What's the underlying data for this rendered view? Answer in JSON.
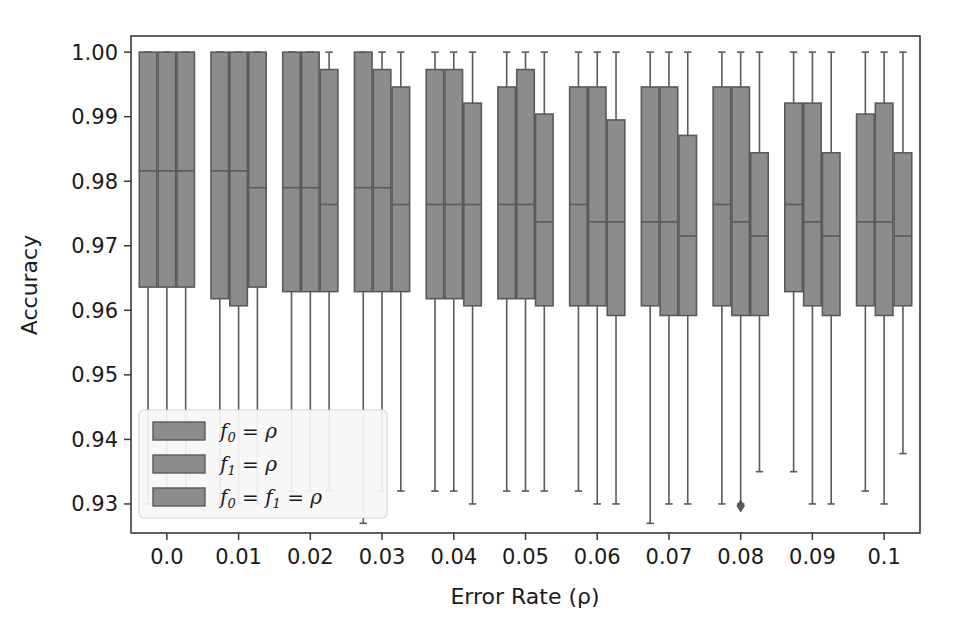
{
  "chart_data": {
    "type": "box",
    "title": "",
    "xlabel": "Error Rate (ρ)",
    "ylabel": "Accuracy",
    "grid": false,
    "legend_position": "lower left",
    "xlim": [
      -0.005,
      0.105
    ],
    "ylim": [
      0.9255,
      1.0025
    ],
    "ytick_labels": [
      "0.93",
      "0.94",
      "0.95",
      "0.96",
      "0.97",
      "0.98",
      "0.99",
      "1.00"
    ],
    "ytick_values": [
      0.93,
      0.94,
      0.95,
      0.96,
      0.97,
      0.98,
      0.99,
      1.0
    ],
    "xtick_labels": [
      "0.0",
      "0.01",
      "0.02",
      "0.03",
      "0.04",
      "0.05",
      "0.06",
      "0.07",
      "0.08",
      "0.09",
      "0.1"
    ],
    "categories": [
      0.0,
      0.01,
      0.02,
      0.03,
      0.04,
      0.05,
      0.06,
      0.07,
      0.08,
      0.09,
      0.1
    ],
    "series": [
      {
        "name": "f_0 = ρ",
        "legend_label": "f₀ = ρ",
        "color": "#8c8c8c",
        "boxes": [
          {
            "category": 0.0,
            "whislo": 0.93,
            "q1": 0.9636,
            "med": 0.9816,
            "q3": 1.0,
            "whishi": 1.0,
            "fliers": []
          },
          {
            "category": 0.01,
            "whislo": 0.93,
            "q1": 0.9618,
            "med": 0.9816,
            "q3": 1.0,
            "whishi": 1.0,
            "fliers": []
          },
          {
            "category": 0.02,
            "whislo": 0.932,
            "q1": 0.9629,
            "med": 0.979,
            "q3": 1.0,
            "whishi": 1.0,
            "fliers": []
          },
          {
            "category": 0.03,
            "whislo": 0.927,
            "q1": 0.9629,
            "med": 0.979,
            "q3": 1.0,
            "whishi": 1.0,
            "fliers": []
          },
          {
            "category": 0.04,
            "whislo": 0.932,
            "q1": 0.9618,
            "med": 0.9764,
            "q3": 0.9973,
            "whishi": 1.0,
            "fliers": []
          },
          {
            "category": 0.05,
            "whislo": 0.932,
            "q1": 0.9618,
            "med": 0.9764,
            "q3": 0.9946,
            "whishi": 1.0,
            "fliers": []
          },
          {
            "category": 0.06,
            "whislo": 0.932,
            "q1": 0.9607,
            "med": 0.9764,
            "q3": 0.9946,
            "whishi": 1.0,
            "fliers": []
          },
          {
            "category": 0.07,
            "whislo": 0.927,
            "q1": 0.9607,
            "med": 0.9737,
            "q3": 0.9946,
            "whishi": 1.0,
            "fliers": []
          },
          {
            "category": 0.08,
            "whislo": 0.93,
            "q1": 0.9607,
            "med": 0.9764,
            "q3": 0.9946,
            "whishi": 1.0,
            "fliers": []
          },
          {
            "category": 0.09,
            "whislo": 0.935,
            "q1": 0.9629,
            "med": 0.9764,
            "q3": 0.9921,
            "whishi": 1.0,
            "fliers": []
          },
          {
            "category": 0.1,
            "whislo": 0.932,
            "q1": 0.9607,
            "med": 0.9737,
            "q3": 0.9904,
            "whishi": 1.0,
            "fliers": []
          }
        ]
      },
      {
        "name": "f_1 = ρ",
        "legend_label": "f₁ = ρ",
        "color": "#8c8c8c",
        "boxes": [
          {
            "category": 0.0,
            "whislo": 0.93,
            "q1": 0.9636,
            "med": 0.9816,
            "q3": 1.0,
            "whishi": 1.0,
            "fliers": []
          },
          {
            "category": 0.01,
            "whislo": 0.93,
            "q1": 0.9607,
            "med": 0.9816,
            "q3": 1.0,
            "whishi": 1.0,
            "fliers": []
          },
          {
            "category": 0.02,
            "whislo": 0.932,
            "q1": 0.9629,
            "med": 0.979,
            "q3": 1.0,
            "whishi": 1.0,
            "fliers": []
          },
          {
            "category": 0.03,
            "whislo": 0.932,
            "q1": 0.9629,
            "med": 0.979,
            "q3": 0.9973,
            "whishi": 1.0,
            "fliers": []
          },
          {
            "category": 0.04,
            "whislo": 0.932,
            "q1": 0.9618,
            "med": 0.9764,
            "q3": 0.9973,
            "whishi": 1.0,
            "fliers": []
          },
          {
            "category": 0.05,
            "whislo": 0.932,
            "q1": 0.9618,
            "med": 0.9764,
            "q3": 0.9973,
            "whishi": 1.0,
            "fliers": []
          },
          {
            "category": 0.06,
            "whislo": 0.93,
            "q1": 0.9607,
            "med": 0.9737,
            "q3": 0.9946,
            "whishi": 1.0,
            "fliers": []
          },
          {
            "category": 0.07,
            "whislo": 0.93,
            "q1": 0.9592,
            "med": 0.9737,
            "q3": 0.9946,
            "whishi": 1.0,
            "fliers": []
          },
          {
            "category": 0.08,
            "whislo": 0.93,
            "q1": 0.9592,
            "med": 0.9737,
            "q3": 0.9946,
            "whishi": 1.0,
            "fliers": [
              0.9297
            ]
          },
          {
            "category": 0.09,
            "whislo": 0.93,
            "q1": 0.9607,
            "med": 0.9737,
            "q3": 0.9921,
            "whishi": 1.0,
            "fliers": []
          },
          {
            "category": 0.1,
            "whislo": 0.93,
            "q1": 0.9592,
            "med": 0.9737,
            "q3": 0.9921,
            "whishi": 1.0,
            "fliers": []
          }
        ]
      },
      {
        "name": "f_0 = f_1 = ρ",
        "legend_label": "f₀ = f₁ = ρ",
        "color": "#8c8c8c",
        "boxes": [
          {
            "category": 0.0,
            "whislo": 0.93,
            "q1": 0.9636,
            "med": 0.9816,
            "q3": 1.0,
            "whishi": 1.0,
            "fliers": []
          },
          {
            "category": 0.01,
            "whislo": 0.93,
            "q1": 0.9636,
            "med": 0.979,
            "q3": 1.0,
            "whishi": 1.0,
            "fliers": []
          },
          {
            "category": 0.02,
            "whislo": 0.932,
            "q1": 0.9629,
            "med": 0.9764,
            "q3": 0.9973,
            "whishi": 1.0,
            "fliers": []
          },
          {
            "category": 0.03,
            "whislo": 0.932,
            "q1": 0.9629,
            "med": 0.9764,
            "q3": 0.9946,
            "whishi": 1.0,
            "fliers": []
          },
          {
            "category": 0.04,
            "whislo": 0.93,
            "q1": 0.9607,
            "med": 0.9764,
            "q3": 0.9921,
            "whishi": 1.0,
            "fliers": []
          },
          {
            "category": 0.05,
            "whislo": 0.932,
            "q1": 0.9607,
            "med": 0.9737,
            "q3": 0.9904,
            "whishi": 1.0,
            "fliers": []
          },
          {
            "category": 0.06,
            "whislo": 0.93,
            "q1": 0.9592,
            "med": 0.9737,
            "q3": 0.9895,
            "whishi": 1.0,
            "fliers": []
          },
          {
            "category": 0.07,
            "whislo": 0.93,
            "q1": 0.9592,
            "med": 0.9715,
            "q3": 0.9871,
            "whishi": 1.0,
            "fliers": []
          },
          {
            "category": 0.08,
            "whislo": 0.935,
            "q1": 0.9592,
            "med": 0.9715,
            "q3": 0.9844,
            "whishi": 1.0,
            "fliers": []
          },
          {
            "category": 0.09,
            "whislo": 0.93,
            "q1": 0.9592,
            "med": 0.9715,
            "q3": 0.9844,
            "whishi": 1.0,
            "fliers": []
          },
          {
            "category": 0.1,
            "whislo": 0.9378,
            "q1": 0.9607,
            "med": 0.9715,
            "q3": 0.9844,
            "whishi": 1.0,
            "fliers": []
          }
        ]
      }
    ]
  }
}
